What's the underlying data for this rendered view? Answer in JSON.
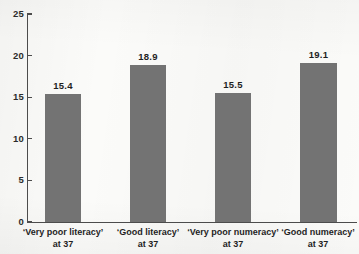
{
  "chart_data": {
    "type": "bar",
    "title": "",
    "cropped_title_ghost": "",
    "xlabel": "",
    "ylabel": "",
    "categories": [
      "‘Very poor literacy’",
      "‘Good literacy’",
      "‘Very poor numeracy’",
      "‘Good numeracy’"
    ],
    "category_sublabels": [
      "at 37",
      "at 37",
      "at 37",
      "at 37"
    ],
    "values": [
      15.4,
      18.9,
      15.5,
      19.1
    ],
    "value_labels": [
      "15.4",
      "18.9",
      "15.5",
      "19.1"
    ],
    "ylim": [
      0,
      25
    ],
    "yticks": [
      0,
      5,
      10,
      15,
      20,
      25
    ],
    "ytick_labels": [
      "0",
      "5",
      "10",
      "15",
      "20",
      "25"
    ],
    "grid": false,
    "legend": false,
    "bar_color": "#737373",
    "axis_color": "#4c4c4c",
    "background_color": "#fbfbf9"
  }
}
